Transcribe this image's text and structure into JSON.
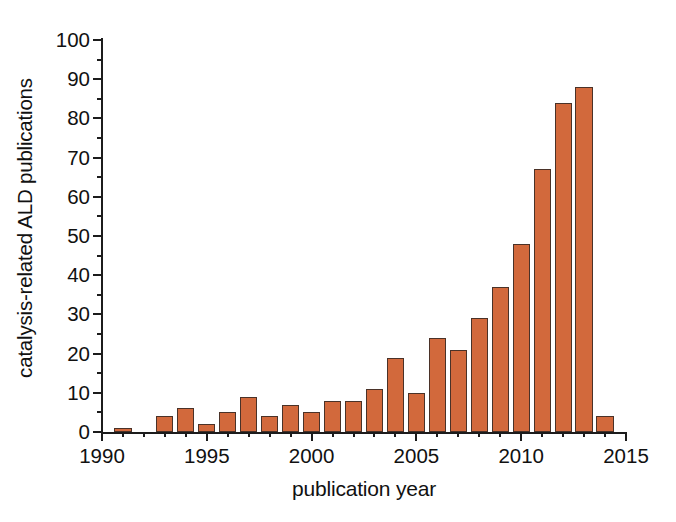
{
  "chart_data": {
    "type": "bar",
    "title": "",
    "xlabel": "publication year",
    "ylabel": "catalysis-related ALD publications",
    "xlim": [
      1990,
      2015
    ],
    "ylim": [
      0,
      100
    ],
    "grid": false,
    "legend": null,
    "bar_color": "#d2693c",
    "bar_edge_color": "#4a3228",
    "axis_color": "#1c1c1c",
    "x_major_ticks": [
      1990,
      1995,
      2000,
      2005,
      2010,
      2015
    ],
    "x_major_tick_labels": [
      "1990",
      "1995",
      "2000",
      "2005",
      "2010",
      "2015"
    ],
    "x_minor_tick_interval": 1,
    "y_major_ticks": [
      0,
      10,
      20,
      30,
      40,
      50,
      60,
      70,
      80,
      90,
      100
    ],
    "y_major_tick_labels": [
      "0",
      "10",
      "20",
      "30",
      "40",
      "50",
      "60",
      "70",
      "80",
      "90",
      "100"
    ],
    "y_minor_tick_interval": 5,
    "categories": [
      1991,
      1992,
      1993,
      1994,
      1995,
      1996,
      1997,
      1998,
      1999,
      2000,
      2001,
      2002,
      2003,
      2004,
      2005,
      2006,
      2007,
      2008,
      2009,
      2010,
      2011,
      2012,
      2013,
      2014
    ],
    "values": [
      1,
      0,
      4,
      6,
      2,
      5,
      9,
      4,
      7,
      5,
      8,
      8,
      11,
      19,
      10,
      24,
      21,
      29,
      37,
      48,
      67,
      84,
      88,
      4
    ],
    "bar_width_years": 0.82
  }
}
